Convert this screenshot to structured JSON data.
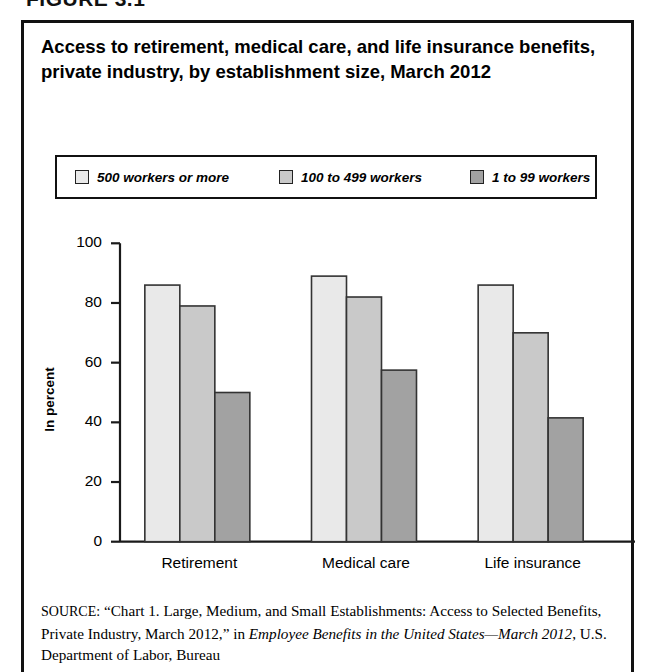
{
  "figure_label": "FIGURE 3.1",
  "chart_title": "Access to retirement, medical care, and life insurance benefits, private industry, by establishment size, March 2012",
  "source": {
    "prefix": "SOURCE:",
    "part1": " “Chart 1. Large, Medium, and Small Establishments: Access to Selected Benefits, Private Industry, March 2012,” in ",
    "italic1": "Employee Benefits in the United States—March 2012",
    "part2": ", U.S. Department of Labor, Bureau"
  },
  "colors": {
    "series_500_plus": "#e9e9e9",
    "series_100_499": "#c9c9c9",
    "series_1_99": "#a2a2a2",
    "bar_outline": "#333333",
    "axis": "#1a1a1a",
    "text": "#000000"
  },
  "chart_data": {
    "type": "bar",
    "title": "Access to retirement, medical care, and life insurance benefits, private industry, by establishment size, March 2012",
    "xlabel": "",
    "ylabel": "In percent",
    "ylim": [
      0,
      100
    ],
    "yticks": [
      0,
      20,
      40,
      60,
      80,
      100
    ],
    "ytick_labels": [
      "0",
      "20",
      "40",
      "60",
      "80",
      "100"
    ],
    "grid": false,
    "legend_position": "top",
    "categories": [
      "Retirement",
      "Medical care",
      "Life insurance"
    ],
    "series": [
      {
        "name": "500 workers or more",
        "color": "#e9e9e9",
        "values": [
          86,
          89,
          86
        ]
      },
      {
        "name": "100 to 499 workers",
        "color": "#c9c9c9",
        "values": [
          79,
          82,
          70
        ]
      },
      {
        "name": "1 to 99 workers",
        "color": "#a2a2a2",
        "values": [
          50,
          57.5,
          41.5
        ]
      }
    ]
  }
}
